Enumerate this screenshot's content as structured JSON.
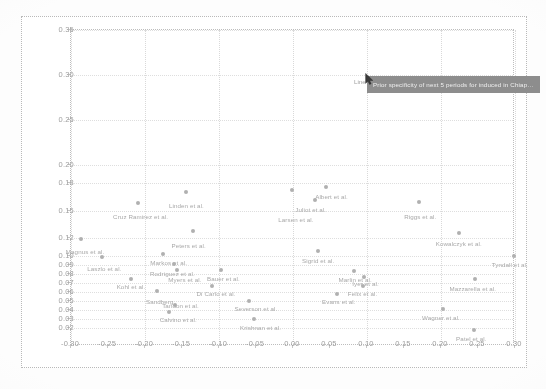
{
  "figure": {
    "type_label": "scatter-plot",
    "tooltip": {
      "hover_label": "Line",
      "text": "Prior specificity of next 5 periods for induced in Chiapas sero..."
    }
  },
  "chart_data": {
    "type": "scatter",
    "title": "",
    "xlabel": "",
    "ylabel": "",
    "xlim": [
      -0.3,
      0.3
    ],
    "ylim": [
      0.0,
      0.35
    ],
    "grid": true,
    "legend": "none",
    "xticks": [
      "-0.30",
      "-0.25",
      "-0.20",
      "-0.15",
      "-0.10",
      "-0.05",
      "0.00",
      "0.05",
      "0.10",
      "0.15",
      "0.20",
      "0.25",
      "0.30"
    ],
    "yticks": [
      "0.35",
      "0.30",
      "0.25",
      "0.20",
      "0.18",
      "0.15",
      "0.12",
      "0.10",
      "0.09",
      "0.08",
      "0.07",
      "0.06",
      "0.05",
      "0.04",
      "0.03",
      "0.02"
    ],
    "points": [
      {
        "label": "Linden et al.",
        "x": -0.144,
        "y": 0.171,
        "lx": -0.144,
        "ly": 0.16
      },
      {
        "label": "Cruz Ramirez et al.",
        "x": -0.21,
        "y": 0.158,
        "lx": -0.206,
        "ly": 0.147
      },
      {
        "label": "Magnus et al.",
        "x": -0.286,
        "y": 0.118,
        "lx": -0.281,
        "ly": 0.109
      },
      {
        "label": "Peters et al.",
        "x": -0.135,
        "y": 0.127,
        "lx": -0.141,
        "ly": 0.1155
      },
      {
        "label": "Markos et al.",
        "x": -0.176,
        "y": 0.1015,
        "lx": -0.168,
        "ly": 0.096
      },
      {
        "label": "Laszlo et al.",
        "x": -0.258,
        "y": 0.099,
        "lx": -0.255,
        "ly": 0.0895
      },
      {
        "label": "Rodriguez et al.",
        "x": -0.161,
        "y": 0.0905,
        "lx": -0.163,
        "ly": 0.0845
      },
      {
        "label": "Myers et al.",
        "x": -0.157,
        "y": 0.084,
        "lx": -0.146,
        "ly": 0.0775
      },
      {
        "label": "Bauer et al.",
        "x": -0.097,
        "y": 0.0845,
        "lx": -0.094,
        "ly": 0.079
      },
      {
        "label": "Kohl et al.",
        "x": -0.219,
        "y": 0.0745,
        "lx": -0.219,
        "ly": 0.07
      },
      {
        "label": "Di Carlo et al.",
        "x": -0.11,
        "y": 0.066,
        "lx": -0.104,
        "ly": 0.0625
      },
      {
        "label": "Sandberg",
        "x": -0.184,
        "y": 0.061,
        "lx": -0.18,
        "ly": 0.053
      },
      {
        "label": "Tandon et al.",
        "x": -0.16,
        "y": 0.045,
        "lx": -0.152,
        "ly": 0.049
      },
      {
        "label": "Calvino et al.",
        "x": -0.168,
        "y": 0.038,
        "lx": -0.155,
        "ly": 0.033
      },
      {
        "label": "Krishnan et al.",
        "x": -0.053,
        "y": 0.03,
        "lx": -0.044,
        "ly": 0.0245
      },
      {
        "label": "Severson et al.",
        "x": -0.06,
        "y": 0.0495,
        "lx": -0.05,
        "ly": 0.045
      },
      {
        "label": "Albert et al.",
        "x": 0.044,
        "y": 0.176,
        "lx": 0.052,
        "ly": 0.17
      },
      {
        "label": "Juliot et al.",
        "x": 0.03,
        "y": 0.1615,
        "lx": 0.024,
        "ly": 0.155
      },
      {
        "label": "Larsen et al.",
        "x": -0.002,
        "y": 0.1725,
        "lx": 0.004,
        "ly": 0.144
      },
      {
        "label": "Riggs et al.",
        "x": 0.17,
        "y": 0.159,
        "lx": 0.172,
        "ly": 0.1475
      },
      {
        "label": "Sigrid et al.",
        "x": 0.034,
        "y": 0.105,
        "lx": 0.034,
        "ly": 0.099
      },
      {
        "label": "Kowalczyk et al.",
        "x": 0.224,
        "y": 0.125,
        "lx": 0.224,
        "ly": 0.1175
      },
      {
        "label": "Tyndall et al.",
        "x": 0.298,
        "y": 0.1,
        "lx": 0.293,
        "ly": 0.0945
      },
      {
        "label": "Marlin et al.",
        "x": 0.083,
        "y": 0.083,
        "lx": 0.084,
        "ly": 0.0775
      },
      {
        "label": "Iyer et al.",
        "x": 0.096,
        "y": 0.076,
        "lx": 0.098,
        "ly": 0.0735
      },
      {
        "label": "Felix et al.",
        "x": 0.095,
        "y": 0.067,
        "lx": 0.094,
        "ly": 0.062
      },
      {
        "label": "Mazzarella et al.",
        "x": 0.246,
        "y": 0.074,
        "lx": 0.243,
        "ly": 0.0675
      },
      {
        "label": "Evans et al.",
        "x": 0.06,
        "y": 0.058,
        "lx": 0.062,
        "ly": 0.053
      },
      {
        "label": "Wagner et al.",
        "x": 0.203,
        "y": 0.041,
        "lx": 0.2,
        "ly": 0.0355
      },
      {
        "label": "Patel et al.",
        "x": 0.244,
        "y": 0.018,
        "lx": 0.241,
        "ly": 0.0125
      }
    ]
  }
}
